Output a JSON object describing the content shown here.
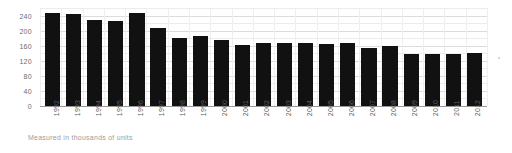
{
  "caption": "Measured in thousands of units",
  "colors": {
    "bar": "#111111",
    "gridline": "#dcdcdc",
    "axis_text": "#6d6d6d",
    "caption_text": "#9d9d9d",
    "background": "#ffffff"
  },
  "chart_data": {
    "type": "bar",
    "title": "",
    "subtitle": "",
    "xlabel": "",
    "ylabel": "",
    "note": "Measured in thousands of units",
    "categories": [
      "1992",
      "1993",
      "1994",
      "1995",
      "1996",
      "1997",
      "1998",
      "1999",
      "2000",
      "2001",
      "2002",
      "2003",
      "2004",
      "2005",
      "2006",
      "2007",
      "2008",
      "2009",
      "2010",
      "2011",
      "2012"
    ],
    "values": [
      248,
      243,
      229,
      226,
      247,
      206,
      181,
      186,
      175,
      163,
      166,
      166,
      167,
      164,
      166,
      155,
      159,
      139,
      138,
      139,
      140
    ],
    "ylim": [
      0,
      260
    ],
    "yticks": [
      0,
      40,
      80,
      120,
      160,
      200,
      240
    ],
    "ytick_labels": [
      "0",
      "40",
      "80",
      "120",
      "160",
      "200",
      "240"
    ],
    "grid": true,
    "grid_axis": "y",
    "legend": false,
    "legend_position": "none",
    "series": [
      {
        "name": "units",
        "values": [
          248,
          243,
          229,
          226,
          247,
          206,
          181,
          186,
          175,
          163,
          166,
          166,
          167,
          164,
          166,
          155,
          159,
          139,
          138,
          139,
          140
        ]
      }
    ]
  }
}
